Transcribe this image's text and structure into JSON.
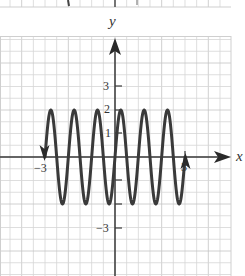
{
  "chart_data": {
    "type": "line",
    "title": "",
    "xlabel": "x",
    "ylabel": "y",
    "function": "y = 2 sin(2πx)",
    "domain": [
      -3,
      3
    ],
    "xlim": [
      -4.5,
      4.9
    ],
    "ylim": [
      -5,
      4.5
    ],
    "grid": true,
    "grid_step": 0.5,
    "amplitude": 2,
    "period": 1,
    "x_tick_labels": [
      "-3",
      "3"
    ],
    "y_tick_labels": [
      "3",
      "2",
      "1",
      "-3"
    ],
    "end_arrows": {
      "left": "down",
      "right": "up"
    },
    "series": [
      {
        "name": "curve",
        "x": [
          -3,
          -2.75,
          -2.5,
          -2.25,
          -2,
          -1.75,
          -1.5,
          -1.25,
          -1,
          -0.75,
          -0.5,
          -0.25,
          0,
          0.25,
          0.5,
          0.75,
          1,
          1.25,
          1.5,
          1.75,
          2,
          2.25,
          2.5,
          2.75,
          3
        ],
        "values": [
          0,
          2,
          0,
          -2,
          0,
          2,
          0,
          -2,
          0,
          2,
          0,
          -2,
          0,
          2,
          0,
          -2,
          0,
          2,
          0,
          -2,
          0,
          2,
          0,
          -2,
          0
        ]
      }
    ],
    "colors": {
      "curve": "#3a3a3a",
      "axis": "#3a3a3a",
      "grid": "#d4d4d4",
      "grid_major": "#c4c4c4"
    }
  },
  "labels": {
    "y_axis": "y",
    "x_axis": "x",
    "x_neg3": "−3",
    "x_pos3": "3",
    "y_pos3": "3",
    "y_pos2": "2",
    "y_pos1": "1",
    "y_neg3": "−3"
  }
}
